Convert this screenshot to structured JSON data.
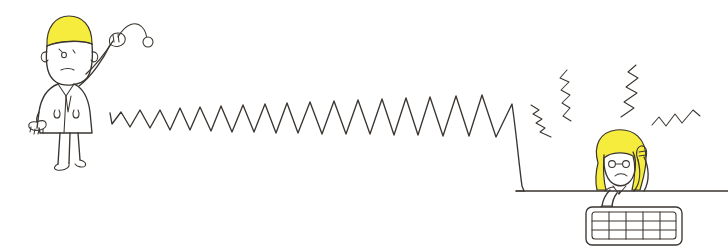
{
  "illustration": {
    "title": "Hand-drawn cartoon: person throwing a ball and a stressed person at a computer",
    "background_color": "#ffffff",
    "ink_color": "#3a3530",
    "hair_color": "#f5ec3d",
    "width": 728,
    "height": 252
  },
  "figures": {
    "thrower": {
      "name": "thrower-figure",
      "description": "Standing person with short blonde hair wearing a long coat, right arm raised overhead having just thrown a ball",
      "hair_color": "#f5ec3d",
      "position": {
        "x": 32,
        "y": 14,
        "width": 110,
        "height": 155
      }
    },
    "worker": {
      "name": "worker-figure",
      "description": "Seated person with long blonde hair at a desk, one hand on head, one hand on keyboard, worried expression",
      "hair_color": "#f5ec3d",
      "position": {
        "x": 578,
        "y": 128,
        "width": 115,
        "height": 124
      }
    }
  },
  "objects": {
    "ball": {
      "name": "thrown-ball",
      "description": "Small circle at the end of the throw arc",
      "cx": 148,
      "cy": 42,
      "r": 5
    },
    "throw_arc": {
      "name": "throw-trajectory-arc",
      "description": "Curved dashed-like arc showing the path of the thrown ball"
    },
    "keyboard": {
      "name": "computer-keyboard",
      "description": "Rounded rectangle keyboard with a grid of keys, 5 columns by 3 rows",
      "columns": 5,
      "rows": 3,
      "x": 586,
      "y": 207,
      "width": 96,
      "height": 38
    },
    "desk": {
      "name": "desk-surface-line",
      "description": "Horizontal line representing the desk edge",
      "y": 192,
      "x_start": 516,
      "x_end": 728
    }
  },
  "zigzag_line": {
    "name": "zigzag-signal-line",
    "description": "Long jagged sawtooth line running from the thrower to the worker, with growing amplitude, ending in a sharp peak and a steep drop to the desk level",
    "start": {
      "x": 110,
      "y": 116
    },
    "peak_count": 13,
    "baseline_y": 131,
    "final_peak": {
      "x": 512,
      "y": 104
    },
    "drop_to": {
      "x": 523,
      "y": 190
    }
  },
  "stress_marks": {
    "name": "stress-lightning-marks",
    "description": "Four small jagged lightning-bolt marks radiating around the worker's head indicating stress",
    "count": 4,
    "items": [
      {
        "name": "stress-mark-left-low",
        "x": 533,
        "y": 107
      },
      {
        "name": "stress-mark-left-high",
        "x": 563,
        "y": 70
      },
      {
        "name": "stress-mark-right-high",
        "x": 622,
        "y": 66
      },
      {
        "name": "stress-mark-right-low",
        "x": 655,
        "y": 113
      }
    ]
  }
}
